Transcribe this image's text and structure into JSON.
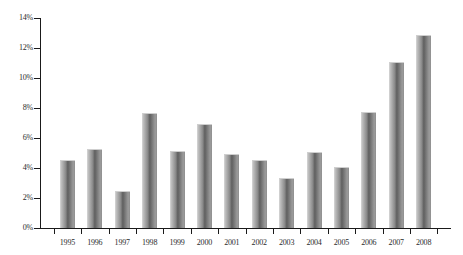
{
  "chart_data": {
    "type": "bar",
    "title": "",
    "subtitle": "",
    "xlabel": "",
    "ylabel": "",
    "categories": [
      "1995",
      "1996",
      "1997",
      "1998",
      "1999",
      "2000",
      "2001",
      "2002",
      "2003",
      "2004",
      "2005",
      "2006",
      "2007",
      "2008"
    ],
    "values": [
      4.5,
      5.2,
      2.4,
      7.6,
      5.1,
      6.9,
      4.9,
      4.5,
      3.3,
      5.0,
      4.0,
      7.7,
      11.0,
      12.8
    ],
    "value_labels": [
      "4.5%",
      "5.2%",
      "2.4%",
      "7.6%",
      "5.1%",
      "6.9%",
      "4.9%",
      "4.5%",
      "3.3%",
      "5.0%",
      "4.0%",
      "7.7%",
      "11.0%",
      "12.8%"
    ],
    "ylim": [
      0,
      14
    ],
    "ytick_values": [
      0,
      2,
      4,
      6,
      8,
      10,
      12,
      14
    ],
    "ytick_labels": [
      "0%",
      "2%",
      "4%",
      "6%",
      "8%",
      "10%",
      "12%",
      "14%"
    ],
    "grid": false,
    "legend": null,
    "legend_position": "none",
    "series": [
      {
        "name": "",
        "values": [
          4.5,
          5.2,
          2.4,
          7.6,
          5.1,
          6.9,
          4.9,
          4.5,
          3.3,
          5.0,
          4.0,
          7.7,
          11.0,
          12.8
        ]
      }
    ],
    "colors": {
      "bar_light": "#d8d8d8",
      "bar_mid": "#8a8a8a",
      "bar_dark": "#5f5f5f",
      "axis": "#1a1a1a",
      "text": "#2b2b2b",
      "background": "#ffffff"
    }
  }
}
